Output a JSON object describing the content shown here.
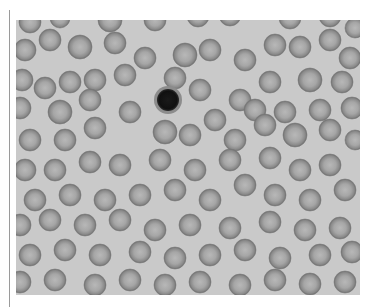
{
  "image": {
    "subject": "blood smear micrograph",
    "description": "Grayscale light micrograph of red blood cells with a single dark-nucleated white blood cell (lymphocyte) near the upper center",
    "colors": {
      "background": "#c9c9c9",
      "rbc_edge": "#7a7a7a",
      "rbc_center": "#b4b4b4",
      "nucleus": "#141414"
    },
    "rbcs": [
      [
        30,
        22,
        11
      ],
      [
        60,
        18,
        10
      ],
      [
        110,
        20,
        12
      ],
      [
        155,
        20,
        11
      ],
      [
        198,
        16,
        11
      ],
      [
        230,
        15,
        11
      ],
      [
        290,
        18,
        11
      ],
      [
        330,
        16,
        11
      ],
      [
        355,
        28,
        10
      ],
      [
        25,
        50,
        11
      ],
      [
        50,
        40,
        11
      ],
      [
        80,
        47,
        12
      ],
      [
        115,
        43,
        11
      ],
      [
        145,
        58,
        11
      ],
      [
        185,
        55,
        12
      ],
      [
        210,
        50,
        11
      ],
      [
        245,
        60,
        11
      ],
      [
        275,
        45,
        11
      ],
      [
        300,
        47,
        11
      ],
      [
        330,
        40,
        11
      ],
      [
        350,
        58,
        11
      ],
      [
        22,
        80,
        11
      ],
      [
        45,
        88,
        11
      ],
      [
        70,
        82,
        11
      ],
      [
        95,
        80,
        11
      ],
      [
        125,
        75,
        11
      ],
      [
        200,
        90,
        11
      ],
      [
        240,
        100,
        11
      ],
      [
        270,
        82,
        11
      ],
      [
        310,
        80,
        12
      ],
      [
        342,
        82,
        11
      ],
      [
        20,
        108,
        11
      ],
      [
        60,
        112,
        12
      ],
      [
        90,
        100,
        11
      ],
      [
        130,
        112,
        11
      ],
      [
        175,
        78,
        11
      ],
      [
        215,
        120,
        11
      ],
      [
        255,
        110,
        11
      ],
      [
        285,
        112,
        11
      ],
      [
        320,
        110,
        11
      ],
      [
        352,
        108,
        11
      ],
      [
        30,
        140,
        11
      ],
      [
        65,
        140,
        11
      ],
      [
        95,
        128,
        11
      ],
      [
        165,
        132,
        12
      ],
      [
        190,
        135,
        11
      ],
      [
        235,
        140,
        11
      ],
      [
        265,
        125,
        11
      ],
      [
        295,
        135,
        12
      ],
      [
        330,
        130,
        11
      ],
      [
        355,
        140,
        10
      ],
      [
        25,
        170,
        11
      ],
      [
        55,
        170,
        11
      ],
      [
        90,
        162,
        11
      ],
      [
        120,
        165,
        11
      ],
      [
        160,
        160,
        11
      ],
      [
        195,
        170,
        11
      ],
      [
        230,
        160,
        11
      ],
      [
        270,
        158,
        11
      ],
      [
        300,
        170,
        11
      ],
      [
        330,
        165,
        11
      ],
      [
        35,
        200,
        11
      ],
      [
        70,
        195,
        11
      ],
      [
        105,
        200,
        11
      ],
      [
        140,
        195,
        11
      ],
      [
        175,
        190,
        11
      ],
      [
        210,
        200,
        11
      ],
      [
        245,
        185,
        11
      ],
      [
        275,
        195,
        11
      ],
      [
        310,
        200,
        11
      ],
      [
        345,
        190,
        11
      ],
      [
        20,
        225,
        11
      ],
      [
        50,
        220,
        11
      ],
      [
        85,
        225,
        11
      ],
      [
        120,
        220,
        11
      ],
      [
        155,
        230,
        11
      ],
      [
        190,
        225,
        11
      ],
      [
        230,
        228,
        11
      ],
      [
        270,
        222,
        11
      ],
      [
        305,
        230,
        11
      ],
      [
        340,
        228,
        11
      ],
      [
        30,
        255,
        11
      ],
      [
        65,
        250,
        11
      ],
      [
        100,
        255,
        11
      ],
      [
        140,
        252,
        11
      ],
      [
        175,
        258,
        11
      ],
      [
        210,
        255,
        11
      ],
      [
        245,
        250,
        11
      ],
      [
        280,
        258,
        11
      ],
      [
        320,
        255,
        11
      ],
      [
        352,
        252,
        11
      ],
      [
        20,
        282,
        11
      ],
      [
        55,
        280,
        11
      ],
      [
        95,
        285,
        11
      ],
      [
        130,
        280,
        11
      ],
      [
        165,
        285,
        11
      ],
      [
        200,
        282,
        11
      ],
      [
        240,
        285,
        11
      ],
      [
        275,
        280,
        11
      ],
      [
        310,
        284,
        11
      ],
      [
        345,
        282,
        11
      ]
    ],
    "wbc": {
      "x": 168,
      "y": 100,
      "r": 14,
      "nucleus_r": 11
    }
  }
}
